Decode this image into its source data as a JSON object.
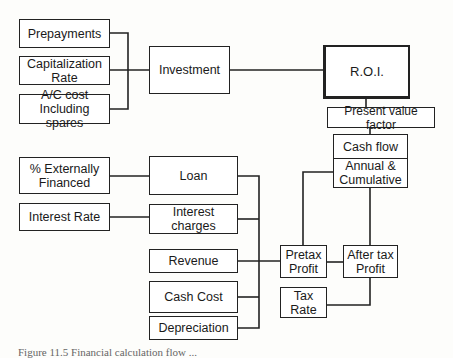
{
  "inputs": {
    "prepayments": "Prepayments",
    "capitalization_rate": "Capitalization Rate",
    "ac_cost": "A/C cost Including spares",
    "externally_financed": "% Externally Financed",
    "interest_rate": "Interest Rate"
  },
  "intermediate": {
    "investment": "Investment",
    "loan": "Loan",
    "interest_charges": "Interest charges",
    "revenue": "Revenue",
    "cash_cost": "Cash Cost",
    "depreciation": "Depreciation",
    "pretax_profit": "Pretax Profit",
    "tax_rate": "Tax Rate",
    "after_tax_profit": "After tax Profit",
    "cash_flow": "Cash flow",
    "annual_cumulative": "Annual & Cumulative",
    "present_value_factor": "Present value factor"
  },
  "output": {
    "roi": "R.O.I."
  },
  "caption": "Figure 11.5   Financial calculation flow ..."
}
